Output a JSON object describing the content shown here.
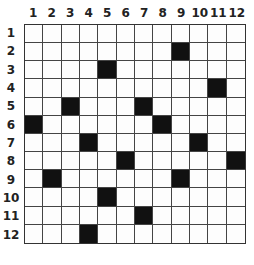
{
  "puzzle": {
    "rows": 12,
    "cols": 12,
    "column_labels": [
      "1",
      "2",
      "3",
      "4",
      "5",
      "6",
      "7",
      "8",
      "9",
      "10",
      "11",
      "12"
    ],
    "row_labels": [
      "1",
      "2",
      "3",
      "4",
      "5",
      "6",
      "7",
      "8",
      "9",
      "10",
      "11",
      "12"
    ],
    "black_cells": [
      [
        2,
        9
      ],
      [
        3,
        5
      ],
      [
        4,
        11
      ],
      [
        5,
        3
      ],
      [
        5,
        7
      ],
      [
        6,
        1
      ],
      [
        6,
        8
      ],
      [
        7,
        4
      ],
      [
        7,
        10
      ],
      [
        8,
        6
      ],
      [
        8,
        12
      ],
      [
        9,
        2
      ],
      [
        9,
        9
      ],
      [
        10,
        5
      ],
      [
        11,
        7
      ],
      [
        12,
        4
      ]
    ],
    "colors": {
      "filled": "#111111",
      "empty": "#fdfdfd",
      "grid_line": "#444444"
    }
  }
}
